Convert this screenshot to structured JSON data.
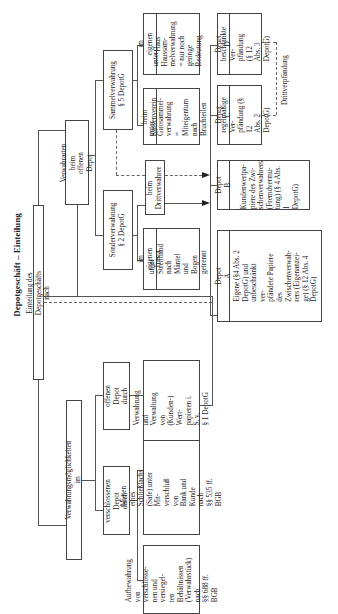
{
  "title": "Depotgeschäft – Einteilung",
  "root": "Einteilung des Depotgeschäfts nach",
  "branch_left": {
    "label": "Verwahrungsmöglichkeiten im",
    "offenes": {
      "label": "offenen Depot\ndurch",
      "desc": "Verwahrung und\nVerwaltung von\n(Kunden-) Wert-\npapieren i. S. v.\n§ 1 DepotG"
    },
    "verschlossenes": {
      "label": "verschlossenen Depot\ndurch",
      "desc_safe": "Mieten eines\nSchließfachs\n(Safe) unter Mit-\nverschluß von\nBank und Kunde\nnach\n§§ 535 ff. BGB",
      "desc_verwahr": "Aufbewahrung\nvon verschlosse-\nnen und versiegel-\nten Behältnissen\n(Verwahrstück)\nnach\n§§ 688 ff. BGB"
    }
  },
  "branch_right": {
    "label": "Verwahrarten beim\noffenen Depot",
    "sammel": {
      "label": "Sammelverwahrung\n§ 5 DepotG",
      "kassenverein_head": "beim Kassenverein",
      "kassenverein_body": "unter Girosammel-\nverwahrung\n= Miteigentum\nnach Bruchteilen",
      "haus_head": "im eigenen Haus",
      "haus_body": "unter Haussam-\nmelverwahrung\n= nur noch geringe\nBedeutung"
    },
    "sonder": {
      "label": "Sonderverwahrung\n§ 2 DepotG",
      "tresor_head": "im eigenen Tresor",
      "tresor_body": "unter Streifband\nnach Mäntel und\nBogen getrennt"
    },
    "dritt": "beim\nDrittverwahrer"
  },
  "depots": {
    "A": {
      "head": "Depot A",
      "body": "Eigene (§4 Abs. 2\nDepotG) und\nunbeschränkt ver-\npfändete Papiere\ndes\nZwischenverwah-\nrers (Eigenanzei-\nge) (§ 12 Abs. 4\nDepotG)"
    },
    "B": {
      "head": "Depot B",
      "body": "Kundenwertpa-\npiere des Zwi-\nschenverwahrers\n(Fremdvermu-\ntung) (§ 4 Abs. 1\nDepotG)"
    },
    "C": {
      "head": "Depot C",
      "body": "regelmäßige Ver-\npfändung (§ 12\nAbs. 2 DepotG)"
    },
    "D": {
      "head": "Depot D",
      "body": "beschränkte Ver-\npfändung (§ 12\nAbs. 3 DepotG)"
    }
  },
  "drittverpfaendung": "Drittverpfändung",
  "colors": {
    "line": "#555555",
    "border": "#444444",
    "text": "#222222",
    "background": "#ffffff"
  }
}
